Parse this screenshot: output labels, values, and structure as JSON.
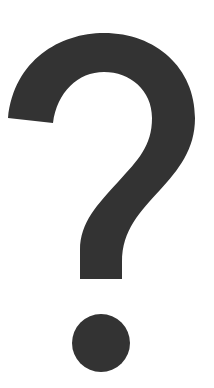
{
  "image": {
    "symbol": "?",
    "icon": "question-mark-icon",
    "colors": {
      "glyph": "#333333",
      "background": "#ffffff"
    }
  }
}
